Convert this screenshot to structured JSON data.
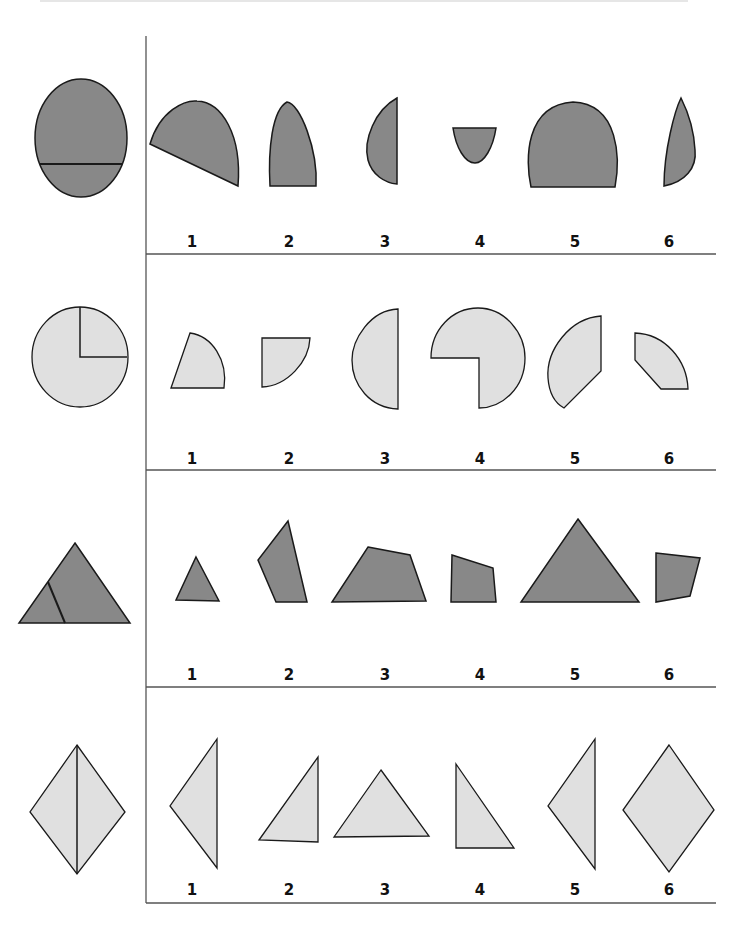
{
  "colors": {
    "dark_fill": "#888888",
    "light_fill": "#e0e0e0",
    "stroke": "#1a1a1a",
    "grid_line": "#555555"
  },
  "rows": [
    {
      "reference": "oval cut by horizontal chord",
      "fill": "dark",
      "options": [
        {
          "label": "1",
          "shape": "tilted half-oval"
        },
        {
          "label": "2",
          "shape": "narrow arch"
        },
        {
          "label": "3",
          "shape": "left half ellipse"
        },
        {
          "label": "4",
          "shape": "small bowl"
        },
        {
          "label": "5",
          "shape": "wide arch"
        },
        {
          "label": "6",
          "shape": "thin leaf"
        }
      ]
    },
    {
      "reference": "circle with quarter sector marked",
      "fill": "light",
      "options": [
        {
          "label": "1",
          "shape": "slanted sector"
        },
        {
          "label": "2",
          "shape": "quarter sector"
        },
        {
          "label": "3",
          "shape": "half circle"
        },
        {
          "label": "4",
          "shape": "three-quarter circle"
        },
        {
          "label": "5",
          "shape": "cut segment"
        },
        {
          "label": "6",
          "shape": "truncated sector"
        }
      ]
    },
    {
      "reference": "triangle cut by slanted line",
      "fill": "dark",
      "options": [
        {
          "label": "1",
          "shape": "small triangle"
        },
        {
          "label": "2",
          "shape": "tall quadrilateral"
        },
        {
          "label": "3",
          "shape": "trapezoid"
        },
        {
          "label": "4",
          "shape": "small quadrilateral"
        },
        {
          "label": "5",
          "shape": "large triangle"
        },
        {
          "label": "6",
          "shape": "irregular quadrilateral"
        }
      ]
    },
    {
      "reference": "rhombus cut vertically",
      "fill": "light",
      "options": [
        {
          "label": "1",
          "shape": "left half triangle"
        },
        {
          "label": "2",
          "shape": "right triangle"
        },
        {
          "label": "3",
          "shape": "isosceles triangle"
        },
        {
          "label": "4",
          "shape": "right triangle flipped"
        },
        {
          "label": "5",
          "shape": "left half triangle"
        },
        {
          "label": "6",
          "shape": "full rhombus"
        }
      ]
    }
  ]
}
